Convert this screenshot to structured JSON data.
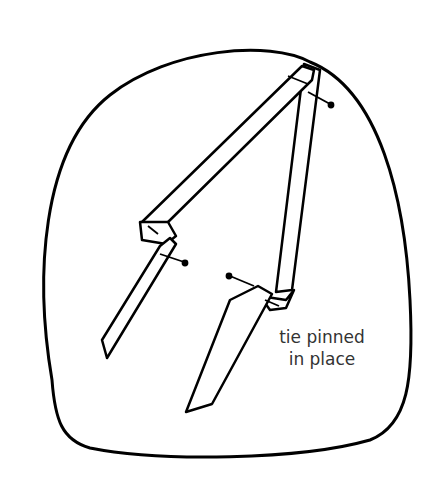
{
  "diagram": {
    "label_line1": "tie pinned",
    "label_line2": "in place",
    "stroke_color": "#000000",
    "background_color": "#ffffff",
    "elements": [
      "head-form-outline",
      "ribbon-tie",
      "pins"
    ]
  }
}
